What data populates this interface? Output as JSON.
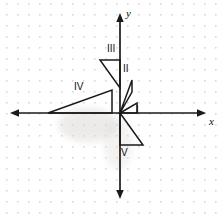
{
  "figure": {
    "width": 223,
    "height": 218,
    "background": "#ffffff",
    "ink_color": "#1a1a1a",
    "grid_dot_color": "#d6d6d6",
    "grid_spacing": 11
  },
  "axes": {
    "origin": {
      "x": 120,
      "y": 113
    },
    "x_axis": {
      "label": "x",
      "label_pos": {
        "x": 209,
        "y": 118
      },
      "start": {
        "x": 11,
        "y": 113
      },
      "end": {
        "x": 205,
        "y": 113
      },
      "arrows": "both"
    },
    "y_axis": {
      "label": "y",
      "label_pos": {
        "x": 126,
        "y": 9
      },
      "start": {
        "x": 120,
        "y": 14
      },
      "end": {
        "x": 120,
        "y": 198
      },
      "arrows": "both"
    }
  },
  "chart_data": {
    "type": "diagram",
    "title": "",
    "xlabel": "x",
    "ylabel": "y",
    "grid": true,
    "shapes": [
      {
        "label": "I",
        "kind": "right-triangle",
        "points": [
          [
            120,
            113
          ],
          [
            137,
            103
          ],
          [
            137,
            113
          ]
        ],
        "label_pos": {
          "x": 138,
          "y": 107
        }
      },
      {
        "label": "II",
        "kind": "right-triangle",
        "points": [
          [
            120,
            113
          ],
          [
            132,
            80
          ],
          [
            132,
            92
          ]
        ],
        "label_pos": {
          "x": 125,
          "y": 66
        }
      },
      {
        "label": "III",
        "kind": "right-triangle",
        "points": [
          [
            100,
            60
          ],
          [
            120,
            60
          ],
          [
            120,
            88
          ]
        ],
        "label_pos": {
          "x": 109,
          "y": 46
        }
      },
      {
        "label": "IV",
        "kind": "right-triangle",
        "points": [
          [
            48,
            113
          ],
          [
            112,
            90
          ],
          [
            112,
            113
          ]
        ],
        "label_pos": {
          "x": 76,
          "y": 84
        }
      },
      {
        "label": "V",
        "kind": "right-triangle",
        "points": [
          [
            120,
            113
          ],
          [
            143,
            145
          ],
          [
            120,
            145
          ]
        ],
        "label_pos": {
          "x": 123,
          "y": 150
        }
      }
    ]
  },
  "labels": {
    "triangle_1": "I",
    "triangle_2": "II",
    "triangle_3": "III",
    "triangle_4": "IV",
    "triangle_5": "V",
    "x_axis": "x",
    "y_axis": "y"
  }
}
